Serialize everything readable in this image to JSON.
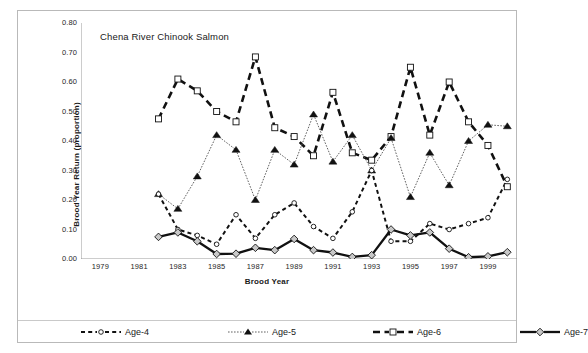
{
  "figure": {
    "chart_title": "Chena River Chinook Salmon",
    "xtitle": "Brood Year",
    "ytitle": "Brood Year Return (proportion)"
  },
  "axes": {
    "y_ticks": [
      "0.80",
      "0.70",
      "0.60",
      "0.50",
      "0.40",
      "0.30",
      "0.20",
      "0.10",
      "0.00"
    ],
    "x_ticks": [
      "1979",
      "1981",
      "1983",
      "1985",
      "1987",
      "1989",
      "1991",
      "1993",
      "1995",
      "1997",
      "1999"
    ]
  },
  "legend": {
    "items": [
      {
        "label": "Age-4",
        "key": "dashed-thin-open-circle"
      },
      {
        "label": "Age-5",
        "key": "dotted-thin-filled-triangle"
      },
      {
        "label": "Age-6",
        "key": "dashed-thick-open-square"
      },
      {
        "label": "Age-7",
        "key": "solid-thick-open-diamond"
      }
    ]
  },
  "chart_data": {
    "type": "line",
    "title": "Chena River Chinook Salmon",
    "xlabel": "Brood Year",
    "ylabel": "Brood Year Return (proportion)",
    "xlim": [
      1978,
      2000.5
    ],
    "ylim": [
      0.0,
      0.8
    ],
    "ytick_values": [
      0.0,
      0.1,
      0.2,
      0.3,
      0.4,
      0.5,
      0.6,
      0.7,
      0.8
    ],
    "xtick_values": [
      1979,
      1981,
      1983,
      1985,
      1987,
      1989,
      1991,
      1993,
      1995,
      1997,
      1999
    ],
    "xminor_tick_values": [
      1980,
      1982,
      1984,
      1986,
      1988,
      1990,
      1992,
      1994,
      1996,
      1998,
      2000
    ],
    "grid": false,
    "legend_position": "bottom",
    "x": [
      1982,
      1983,
      1984,
      1985,
      1986,
      1987,
      1988,
      1989,
      1990,
      1991,
      1992,
      1993,
      1994,
      1995,
      1996,
      1997,
      1998,
      1999,
      2000
    ],
    "series": [
      {
        "name": "Age-4",
        "marker": "open-circle",
        "line": "dashed",
        "width": "thin",
        "values": [
          0.22,
          0.1,
          0.08,
          0.05,
          0.15,
          0.07,
          0.15,
          0.19,
          0.11,
          0.07,
          0.16,
          0.3,
          0.06,
          0.06,
          0.12,
          0.1,
          0.12,
          0.14,
          0.27
        ]
      },
      {
        "name": "Age-5",
        "marker": "filled-triangle",
        "line": "dotted",
        "width": "thin",
        "values": [
          0.22,
          0.17,
          0.28,
          0.42,
          0.37,
          0.2,
          0.37,
          0.32,
          0.49,
          0.33,
          0.42,
          0.3,
          0.41,
          0.21,
          0.36,
          0.25,
          0.4,
          0.455,
          0.45
        ]
      },
      {
        "name": "Age-6",
        "marker": "open-square",
        "line": "dashed",
        "width": "thick",
        "values": [
          0.475,
          0.61,
          0.57,
          0.5,
          0.465,
          0.685,
          0.445,
          0.415,
          0.35,
          0.565,
          0.36,
          0.335,
          0.415,
          0.65,
          0.42,
          0.6,
          0.465,
          0.385,
          0.245
        ]
      },
      {
        "name": "Age-7",
        "marker": "open-diamond",
        "line": "solid",
        "width": "thick",
        "values": [
          0.075,
          0.09,
          0.06,
          0.017,
          0.018,
          0.038,
          0.03,
          0.068,
          0.03,
          0.022,
          0.007,
          0.013,
          0.1,
          0.08,
          0.09,
          0.035,
          0.006,
          0.009,
          0.023
        ]
      }
    ]
  }
}
